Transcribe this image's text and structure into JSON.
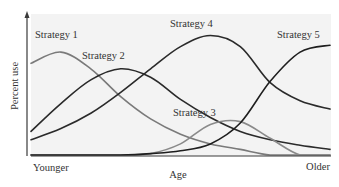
{
  "chart_data": {
    "type": "line",
    "title": "",
    "xlabel": "Age",
    "ylabel": "Percent use",
    "x_tick_labels": {
      "left": "Younger",
      "right": "Older"
    },
    "x": [
      0,
      10,
      20,
      30,
      40,
      50,
      60,
      70,
      80,
      90,
      100
    ],
    "xlim": [
      0,
      100
    ],
    "ylim": [
      0,
      100
    ],
    "grid": false,
    "legend": "inline labels near curves",
    "series": [
      {
        "name": "Strategy 1",
        "color": "#7a7a7a",
        "values": [
          66,
          74,
          62,
          42,
          26,
          15,
          8,
          4,
          0,
          0,
          0
        ]
      },
      {
        "name": "Strategy 2",
        "color": "#2a2a2a",
        "values": [
          17,
          37,
          54,
          62,
          56,
          40,
          27,
          17,
          11,
          7,
          4
        ]
      },
      {
        "name": "Strategy 3",
        "color": "#8a8a8a",
        "values": [
          0,
          0,
          0,
          0,
          1,
          8,
          22,
          24,
          12,
          0,
          0
        ]
      },
      {
        "name": "Strategy 4",
        "color": "#2a2a2a",
        "values": [
          11,
          19,
          30,
          45,
          62,
          78,
          86,
          78,
          52,
          39,
          33
        ]
      },
      {
        "name": "Strategy 5",
        "color": "#1e1e1e",
        "values": [
          0,
          0,
          0,
          0,
          1,
          3,
          8,
          23,
          53,
          74,
          79
        ]
      }
    ],
    "annotations": [
      {
        "text": "Strategy 1",
        "near": "peak of series 1"
      },
      {
        "text": "Strategy 2",
        "near": "peak of series 2"
      },
      {
        "text": "Strategy 3",
        "near": "peak of series 3"
      },
      {
        "text": "Strategy 4",
        "near": "peak of series 4"
      },
      {
        "text": "Strategy 5",
        "near": "right end of series 5"
      }
    ]
  },
  "labels": {
    "y_axis": "Percent use",
    "x_axis": "Age",
    "x_left": "Younger",
    "x_right": "Older",
    "s1": "Strategy 1",
    "s2": "Strategy 2",
    "s3": "Strategy 3",
    "s4": "Strategy 4",
    "s5": "Strategy 5"
  }
}
